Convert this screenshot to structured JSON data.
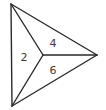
{
  "diagram": {
    "type": "triangle-partitioned-by-interior-point",
    "regions": [
      {
        "id": "left",
        "label": "2"
      },
      {
        "id": "upper",
        "label": "4"
      },
      {
        "id": "lower",
        "label": "6"
      }
    ],
    "line_color": "#2a2a2a",
    "label_color": "#3a3a3a"
  }
}
